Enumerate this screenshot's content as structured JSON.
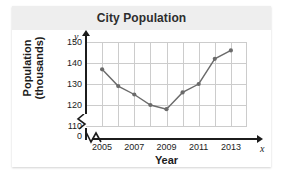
{
  "title": "City Population",
  "colors": {
    "title_band": "#eeeeee",
    "title_text": "#2d2d2d",
    "grid": "#cccccc",
    "axis": "#1c1c1c",
    "series": "#6b6b6b"
  },
  "chart_data": {
    "type": "line",
    "title": "City Population",
    "xlabel": "Year",
    "ylabel": "Population (thousands)",
    "ylabel_lines": [
      "Population",
      "(thousands)"
    ],
    "x_axis_letter": "x",
    "y_axis_letter": "y",
    "x": [
      2005,
      2006,
      2007,
      2008,
      2009,
      2010,
      2011,
      2012,
      2013
    ],
    "values": [
      137,
      129,
      125,
      120,
      118,
      126,
      130,
      142,
      146
    ],
    "xlim": [
      2004,
      2014
    ],
    "ylim": [
      110,
      150
    ],
    "yticks": [
      110,
      120,
      130,
      140,
      150
    ],
    "ytick_labels": [
      "110",
      "120",
      "130",
      "140",
      "150"
    ],
    "y_origin_label": "0",
    "y_axis_break": true,
    "x_axis_break": true,
    "xticks": [
      2005,
      2007,
      2009,
      2011,
      2013
    ],
    "xtick_labels": [
      "2005",
      "2007",
      "2009",
      "2011",
      "2013"
    ],
    "grid": true,
    "legend": null,
    "marker": "circle"
  }
}
